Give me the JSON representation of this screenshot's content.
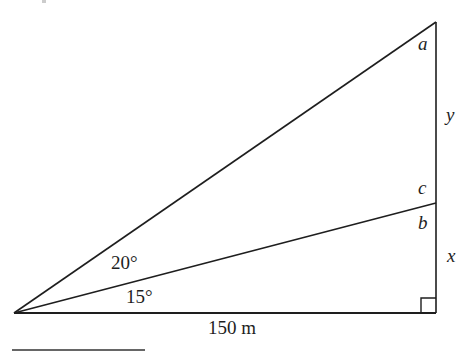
{
  "diagram": {
    "type": "right-triangle-trigonometry",
    "colors": {
      "line": "#1e1e1e",
      "background": "#ffffff"
    },
    "points": {
      "apex": {
        "x": 14,
        "y": 313
      },
      "right_angle_corner": {
        "x": 436,
        "y": 313
      },
      "top": {
        "x": 436,
        "y": 22
      },
      "mid": {
        "x": 436,
        "y": 203
      }
    },
    "labels": {
      "angle_top": "a",
      "segment_upper": "y",
      "angle_mid_upper": "c",
      "angle_mid_lower": "b",
      "segment_lower": "x",
      "angle_upper_at_apex": "20°",
      "angle_lower_at_apex": "15°",
      "base_length": "150 m"
    },
    "right_angle_marker": true
  }
}
